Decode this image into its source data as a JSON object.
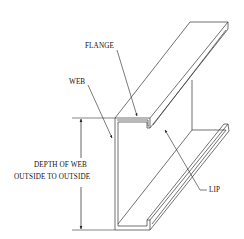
{
  "diagram": {
    "type": "isometric technical drawing",
    "colors": {
      "line": "#222222",
      "background": "#ffffff"
    },
    "labels": {
      "flange": "FLANGE",
      "web": "WEB",
      "depth_line1": "DEPTH OF WEB",
      "depth_line2": "OUTSIDE TO OUTSIDE",
      "lip": "LIP"
    },
    "callouts": [
      {
        "label": "FLANGE",
        "target": "top flange at cross-section"
      },
      {
        "label": "WEB",
        "target": "web plate left face"
      },
      {
        "label": "LIP",
        "target": "underside of top flange lip"
      },
      {
        "label": "DEPTH OF WEB OUTSIDE TO OUTSIDE",
        "target": "dimension arrow spanning web height"
      }
    ]
  }
}
